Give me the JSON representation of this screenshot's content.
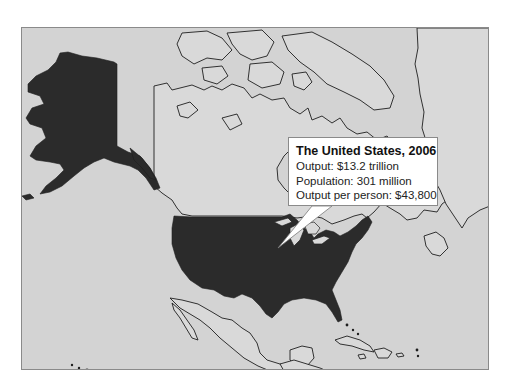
{
  "map": {
    "region": "North America",
    "highlighted_country": "United States",
    "colors": {
      "highlight": "#2b2b2b",
      "land": "#d9d9d9",
      "water": "#d3d3d3",
      "border": "#1e1e1e",
      "frame": "#8a8a8a"
    }
  },
  "callout": {
    "title": "The United States, 2006",
    "lines": [
      "Output: $13.2 trillion",
      "Population: 301 million",
      "Output per person: $43,800"
    ]
  }
}
